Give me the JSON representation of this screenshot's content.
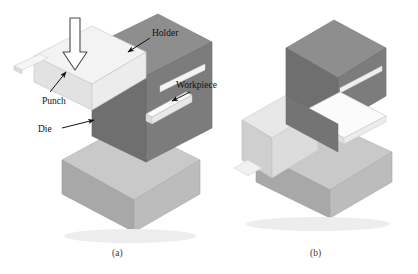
{
  "figure": {
    "background_color": "#ffffff",
    "width": 418,
    "height": 274
  },
  "panels": [
    {
      "id": "a",
      "caption": "(a)",
      "caption_x": 112,
      "caption_y": 256,
      "stage": "before forming",
      "labels": [
        {
          "key": "punch",
          "text": "Punch",
          "x": 42,
          "y": 96
        },
        {
          "key": "holder",
          "text": "Holder",
          "x": 152,
          "y": 38
        },
        {
          "key": "workpiece",
          "text": "Workpiece",
          "x": 176,
          "y": 90
        },
        {
          "key": "die",
          "text": "Die",
          "x": 42,
          "y": 128
        }
      ]
    },
    {
      "id": "b",
      "caption": "(b)",
      "caption_x": 310,
      "caption_y": 256,
      "stage": "after forming",
      "labels": []
    }
  ],
  "components": {
    "punch": {
      "name": "Punch",
      "color_top": "#f3f3f3",
      "color_left": "#e2e2e2",
      "color_front": "#ececec"
    },
    "holder": {
      "name": "Holder",
      "color_top": "#8e8e8e",
      "color_left": "#6f6f6f",
      "color_front": "#7c7c7c"
    },
    "die": {
      "name": "Die",
      "color_top": "#c9c9c9",
      "color_left": "#a8a8a8",
      "color_front": "#bcbcbc"
    },
    "workpiece": {
      "name": "Workpiece",
      "color_top": "#fbfbfb",
      "color_side": "#dcdcdc",
      "color_edge": "#c4c4c4"
    },
    "force_arrow": {
      "name": "Downward forming force arrow",
      "fill": "#ffffff",
      "stroke": "#4a4a4a"
    }
  },
  "icons": {
    "force_arrow": "down-arrow-icon",
    "leader_punch": "leader-arrow-icon",
    "leader_holder": "leader-arrow-icon",
    "leader_workpiece": "leader-arrow-icon",
    "leader_die": "leader-arrow-icon"
  }
}
